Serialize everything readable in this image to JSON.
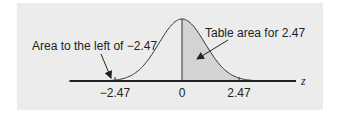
{
  "figure": {
    "background_color": "#ececec",
    "shade_color": "#d3d3d3",
    "axis": {
      "label": "z",
      "ticks": [
        "−2.47",
        "0",
        "2.47"
      ]
    },
    "annotations": {
      "left_tail": "Area to the left of −2.47",
      "table_area": "Table area for 2.47"
    }
  },
  "chart_data": {
    "type": "area",
    "title": "",
    "xlabel": "z",
    "ylabel": "",
    "x_ticks": [
      -2.47,
      0,
      2.47
    ],
    "x_tick_labels": [
      "−2.47",
      "0",
      "2.47"
    ],
    "shaded_region": {
      "from": 0,
      "to": 2.47
    },
    "annotations": [
      {
        "text": "Area to the left of −2.47",
        "points_to": -2.47
      },
      {
        "text": "Table area for 2.47",
        "points_to": "shaded region (0 to 2.47)"
      }
    ],
    "grid": false,
    "legend": false
  }
}
